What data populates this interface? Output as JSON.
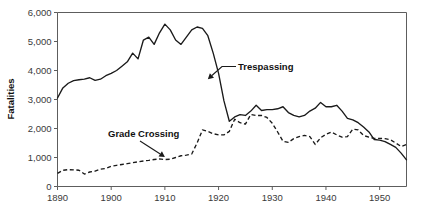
{
  "chart_data": {
    "type": "line",
    "title": "",
    "xlabel": "",
    "ylabel": "Fatalities",
    "xlim": [
      1890,
      1955
    ],
    "ylim": [
      0,
      6000
    ],
    "grid": false,
    "legend_position": "inline-annotations",
    "x_ticks": [
      "1890",
      "1900",
      "1910",
      "1920",
      "1930",
      "1940",
      "1950"
    ],
    "x_tick_values": [
      1890,
      1900,
      1910,
      1920,
      1930,
      1940,
      1950
    ],
    "y_ticks": [
      "0",
      "1,000",
      "2,000",
      "3,000",
      "4,000",
      "5,000",
      "6,000"
    ],
    "y_tick_values": [
      0,
      1000,
      2000,
      3000,
      4000,
      5000,
      6000
    ],
    "x": [
      1890,
      1891,
      1892,
      1893,
      1894,
      1895,
      1896,
      1897,
      1898,
      1899,
      1900,
      1901,
      1902,
      1903,
      1904,
      1905,
      1906,
      1907,
      1908,
      1909,
      1910,
      1911,
      1912,
      1913,
      1914,
      1915,
      1916,
      1917,
      1918,
      1919,
      1920,
      1921,
      1922,
      1923,
      1924,
      1925,
      1926,
      1927,
      1928,
      1929,
      1930,
      1931,
      1932,
      1933,
      1934,
      1935,
      1936,
      1937,
      1938,
      1939,
      1940,
      1941,
      1942,
      1943,
      1944,
      1945,
      1946,
      1947,
      1948,
      1949,
      1950,
      1951,
      1952,
      1953,
      1954,
      1955
    ],
    "series": [
      {
        "name": "Trespassing",
        "style": "solid",
        "annotation": {
          "label": "Trespassing",
          "points_to_year": 1918,
          "points_to_value": 3700
        },
        "values": [
          3050,
          3400,
          3560,
          3650,
          3680,
          3700,
          3750,
          3660,
          3700,
          3820,
          3900,
          4000,
          4150,
          4300,
          4600,
          4400,
          5050,
          5150,
          4900,
          5300,
          5600,
          5400,
          5050,
          4900,
          5150,
          5400,
          5500,
          5450,
          5200,
          4600,
          3900,
          2950,
          2250,
          2400,
          2480,
          2450,
          2600,
          2800,
          2620,
          2650,
          2650,
          2680,
          2750,
          2550,
          2450,
          2400,
          2450,
          2600,
          2700,
          2900,
          2750,
          2750,
          2800,
          2600,
          2350,
          2300,
          2200,
          2050,
          1880,
          1620,
          1600,
          1550,
          1450,
          1350,
          1150,
          920
        ]
      },
      {
        "name": "Grade Crossing",
        "style": "dashed",
        "annotation": {
          "label": "Grade Crossing",
          "points_to_year": 1910,
          "points_to_value": 1020
        },
        "values": [
          450,
          560,
          580,
          575,
          560,
          430,
          500,
          530,
          600,
          620,
          700,
          730,
          760,
          790,
          820,
          850,
          880,
          900,
          930,
          950,
          930,
          940,
          1000,
          1060,
          1080,
          1120,
          1500,
          1950,
          1900,
          1820,
          1780,
          1780,
          1900,
          2320,
          2200,
          2150,
          2480,
          2450,
          2450,
          2380,
          2180,
          1880,
          1560,
          1520,
          1650,
          1720,
          1760,
          1720,
          1450,
          1680,
          1800,
          1880,
          1780,
          1700,
          1720,
          1980,
          1950,
          1760,
          1700,
          1660,
          1660,
          1650,
          1610,
          1500,
          1380,
          1450
        ]
      }
    ]
  },
  "axes": {
    "y_title": "Fatalities"
  },
  "annotations": [
    {
      "name": "trespassing",
      "label": "Trespassing"
    },
    {
      "name": "grade-crossing",
      "label": "Grade Crossing"
    }
  ]
}
